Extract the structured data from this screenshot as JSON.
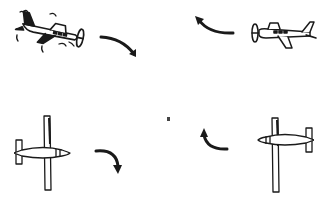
{
  "diagram": {
    "colors": {
      "background": "#ffffff",
      "ink": "#1a1a1a"
    },
    "panels": [
      {
        "id": "top-left",
        "subject": "side-view propeller plane, turbulent (shake lines)",
        "facing": "right",
        "arrow": "curved arrow down-right"
      },
      {
        "id": "top-right",
        "subject": "side-view propeller plane, level flight",
        "facing": "left",
        "arrow": "curved arrow up-left"
      },
      {
        "id": "bottom-left",
        "subject": "top-view high-wing plane",
        "facing": "right",
        "arrow": "curved arrow bending down"
      },
      {
        "id": "bottom-right",
        "subject": "top-view high-wing plane",
        "facing": "left",
        "arrow": "curved arrow bending up"
      }
    ],
    "stray_mark": "small dot near center"
  }
}
